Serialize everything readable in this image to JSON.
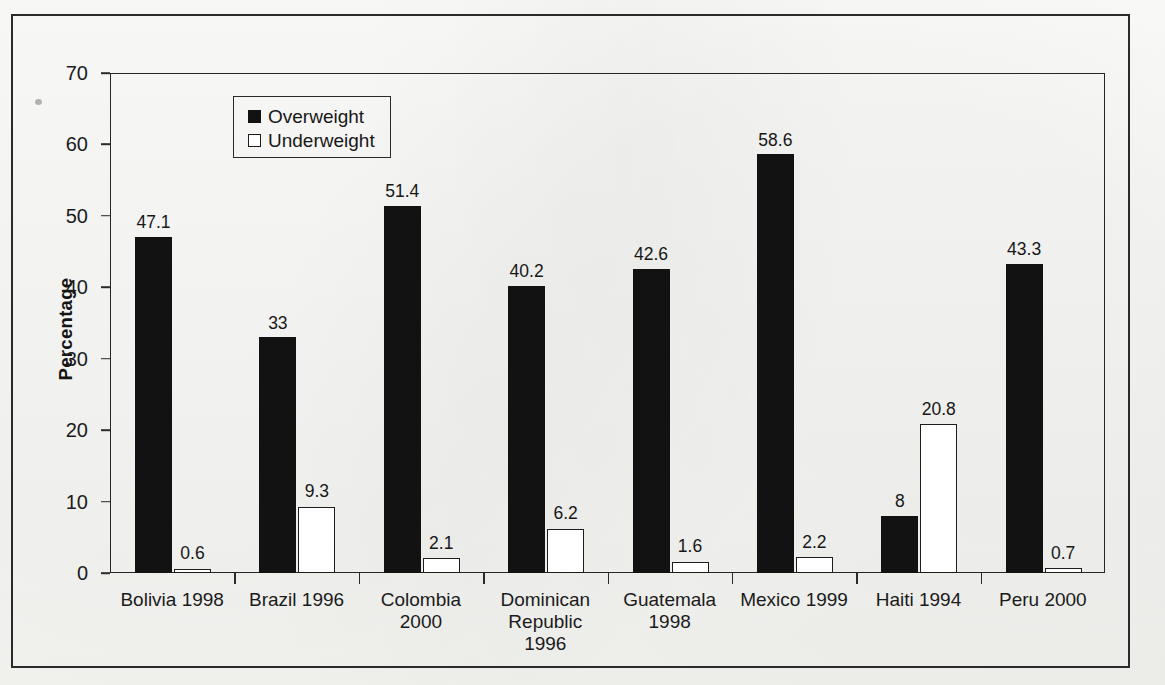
{
  "chart_data": {
    "type": "bar",
    "title": "",
    "xlabel": "",
    "ylabel": "Percentage",
    "ylim": [
      0,
      70
    ],
    "ytick_step": 10,
    "ytick_labels": [
      "70",
      "60",
      "50",
      "40",
      "30",
      "20",
      "10",
      "0"
    ],
    "grid": false,
    "legend_position": "upper-left-inside",
    "categories": [
      "Bolivia 1998",
      "Brazil 1996",
      "Colombia\n2000",
      "Dominican\nRepublic\n1996",
      "Guatemala\n1998",
      "Mexico 1999",
      "Haiti 1994",
      "Peru 2000"
    ],
    "series": [
      {
        "name": "Overweight",
        "color": "#121212",
        "values": [
          47.1,
          33,
          51.4,
          40.2,
          42.6,
          58.6,
          8,
          43.3
        ],
        "labels": [
          "47.1",
          "33",
          "51.4",
          "40.2",
          "42.6",
          "58.6",
          "8",
          "43.3"
        ]
      },
      {
        "name": "Underweight",
        "color": "#ffffff",
        "values": [
          0.6,
          9.3,
          2.1,
          6.2,
          1.6,
          2.2,
          20.8,
          0.7
        ],
        "labels": [
          "0.6",
          "9.3",
          "2.1",
          "6.2",
          "1.6",
          "2.2",
          "20.8",
          "0.7"
        ]
      }
    ]
  },
  "legend": {
    "items": [
      {
        "label": "Overweight",
        "swatch": "filled"
      },
      {
        "label": "Underweight",
        "swatch": "hollow"
      }
    ]
  },
  "axis": {
    "y_title": "Percentage"
  },
  "page": {
    "bleed_text_a": "",
    "bleed_text_b": "",
    "bleed_text_c": ""
  }
}
